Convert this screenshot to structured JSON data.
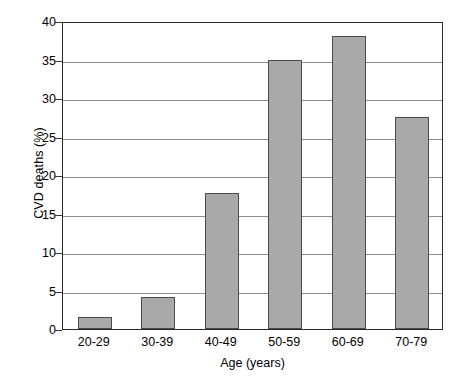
{
  "chart_data": {
    "type": "bar",
    "title": "",
    "subtitle": "",
    "categories": [
      "20-29",
      "30-39",
      "40-49",
      "50-59",
      "60-69",
      "70-79"
    ],
    "values": [
      1.5,
      4.1,
      17.6,
      35.0,
      38.0,
      27.5
    ],
    "series": [
      {
        "name": "CVD deaths",
        "values": [
          1.5,
          4.1,
          17.6,
          35.0,
          38.0,
          27.5
        ]
      }
    ],
    "xlabel": "Age (years)",
    "ylabel": "CVD deaths (%)",
    "ylim": [
      0,
      40
    ],
    "ytick_values": [
      0,
      5,
      10,
      15,
      20,
      25,
      30,
      35,
      40
    ],
    "ytick_labels": [
      "0",
      "5",
      "10",
      "15",
      "20",
      "25",
      "30",
      "35",
      "40"
    ],
    "grid": "horizontal",
    "legend": "none",
    "annotations": [],
    "colors": {
      "bar_fill": "#a9a9a9",
      "bar_edge": "#4a4a4a",
      "gridline": "#8d8d8d",
      "frame": "#2b2b2b",
      "text": "#000000",
      "background": "#ffffff"
    }
  }
}
